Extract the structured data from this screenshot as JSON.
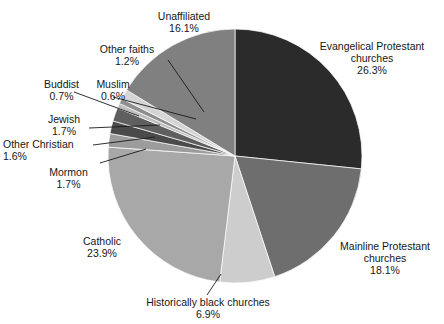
{
  "chart_data": {
    "type": "pie",
    "title": "",
    "subtitle": "",
    "xlabel": "",
    "ylabel": "",
    "grid": false,
    "legend_position": "none",
    "value_unit": "percent",
    "start_angle_deg": 0,
    "direction": "clockwise",
    "total": 100.0,
    "categories": [
      "Evangelical Protestant churches",
      "Mainline Protestant churches",
      "Historically black churches",
      "Catholic",
      "Mormon",
      "Other Christian",
      "Jewish",
      "Muslim",
      "Buddist",
      "Other faiths",
      "Unaffiliated"
    ],
    "values": [
      26.3,
      18.1,
      6.9,
      23.9,
      1.7,
      1.6,
      1.7,
      0.6,
      0.7,
      1.2,
      16.1
    ],
    "colors": [
      "#2b2b2b",
      "#6e6e6e",
      "#cdcdcd",
      "#a8a8a8",
      "#9c9c9c",
      "#4a4a4a",
      "#5f5f5f",
      "#bdbdbd",
      "#8f8f8f",
      "#d5d5d5",
      "#808080"
    ],
    "slices": [
      {
        "label": "Evangelical Protestant churches",
        "value": 26.3,
        "value_label": "26.3%",
        "color": "#2b2b2b"
      },
      {
        "label": "Mainline Protestant churches",
        "value": 18.1,
        "value_label": "18.1%",
        "color": "#6e6e6e"
      },
      {
        "label": "Historically black churches",
        "value": 6.9,
        "value_label": "6.9%",
        "color": "#cdcdcd"
      },
      {
        "label": "Catholic",
        "value": 23.9,
        "value_label": "23.9%",
        "color": "#a8a8a8"
      },
      {
        "label": "Mormon",
        "value": 1.7,
        "value_label": "1.7%",
        "color": "#9c9c9c"
      },
      {
        "label": "Other Christian",
        "value": 1.6,
        "value_label": "1.6%",
        "color": "#4a4a4a"
      },
      {
        "label": "Jewish",
        "value": 1.7,
        "value_label": "1.7%",
        "color": "#5f5f5f"
      },
      {
        "label": "Muslim",
        "value": 0.6,
        "value_label": "0.6%",
        "color": "#bdbdbd"
      },
      {
        "label": "Buddist",
        "value": 0.7,
        "value_label": "0.7%",
        "color": "#8f8f8f"
      },
      {
        "label": "Other faiths",
        "value": 1.2,
        "value_label": "1.2%",
        "color": "#d5d5d5"
      },
      {
        "label": "Unaffiliated",
        "value": 16.1,
        "value_label": "16.1%",
        "color": "#808080"
      }
    ]
  },
  "labels": {
    "evangelical": {
      "line1": "Evangelical Protestant",
      "line2": "churches",
      "pct": "26.3%"
    },
    "mainline": {
      "line1": "Mainline Protestant",
      "line2": "churches",
      "pct": "18.1%"
    },
    "historically_black": {
      "line1": "Historically black churches",
      "pct": "6.9%"
    },
    "catholic": {
      "line1": "Catholic",
      "pct": "23.9%"
    },
    "mormon": {
      "line1": "Mormon",
      "pct": "1.7%"
    },
    "other_christian": {
      "line1": "Other Christian",
      "pct": "1.6%"
    },
    "jewish": {
      "line1": "Jewish",
      "pct": "1.7%"
    },
    "muslim": {
      "line1": "Muslim",
      "pct": "0.6%"
    },
    "buddist": {
      "line1": "Buddist",
      "pct": "0.7%"
    },
    "other_faiths": {
      "line1": "Other faiths",
      "pct": "1.2%"
    },
    "unaffiliated": {
      "line1": "Unaffiliated",
      "pct": "16.1%"
    }
  }
}
